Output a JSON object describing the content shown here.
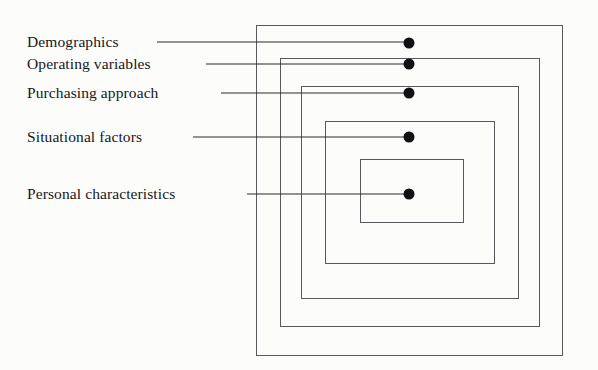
{
  "diagram": {
    "background_color": "#fcfcfb",
    "line_color": "#59595d",
    "dot_color": "#111114",
    "text_color": "#17171a",
    "labels": [
      {
        "text": "Demographics",
        "x": 27,
        "y": 42,
        "leader_x": 157,
        "leader_w": 252
      },
      {
        "text": "Operating variables",
        "x": 27,
        "y": 64,
        "leader_x": 206,
        "leader_w": 203
      },
      {
        "text": "Purchasing approach",
        "x": 27,
        "y": 93,
        "leader_x": 221,
        "leader_w": 188
      },
      {
        "text": "Situational factors",
        "x": 27,
        "y": 137,
        "leader_x": 193,
        "leader_w": 216
      },
      {
        "text": "Personal characteristics",
        "x": 27,
        "y": 194,
        "leader_x": 247,
        "leader_w": 162
      }
    ],
    "rectangles": [
      {
        "name": "demographics-band",
        "x": 256,
        "y": 25,
        "w": 307,
        "h": 331
      },
      {
        "name": "operating-variables-band",
        "x": 280,
        "y": 58,
        "w": 260,
        "h": 269
      },
      {
        "name": "purchasing-approach-band",
        "x": 301,
        "y": 86,
        "w": 218,
        "h": 213
      },
      {
        "name": "situational-factors-band",
        "x": 325,
        "y": 121,
        "w": 170,
        "h": 143
      },
      {
        "name": "personal-characteristics-band",
        "x": 360,
        "y": 159,
        "w": 104,
        "h": 64
      }
    ],
    "dots": [
      {
        "name": "demographics-dot",
        "x": 409,
        "y": 43
      },
      {
        "name": "operating-variables-dot",
        "x": 409,
        "y": 64
      },
      {
        "name": "purchasing-approach-dot",
        "x": 409,
        "y": 93
      },
      {
        "name": "situational-factors-dot",
        "x": 409,
        "y": 137
      },
      {
        "name": "personal-characteristics-dot",
        "x": 409,
        "y": 194
      }
    ]
  },
  "chart_data": {
    "type": "diagram",
    "subtype": "concentric-nested-rectangles",
    "levels": [
      {
        "rank": 1,
        "label": "Demographics",
        "position": "outermost"
      },
      {
        "rank": 2,
        "label": "Operating variables",
        "position": "second"
      },
      {
        "rank": 3,
        "label": "Purchasing approach",
        "position": "third"
      },
      {
        "rank": 4,
        "label": "Situational factors",
        "position": "fourth"
      },
      {
        "rank": 5,
        "label": "Personal characteristics",
        "position": "innermost"
      }
    ],
    "legend": [],
    "grid": false
  }
}
